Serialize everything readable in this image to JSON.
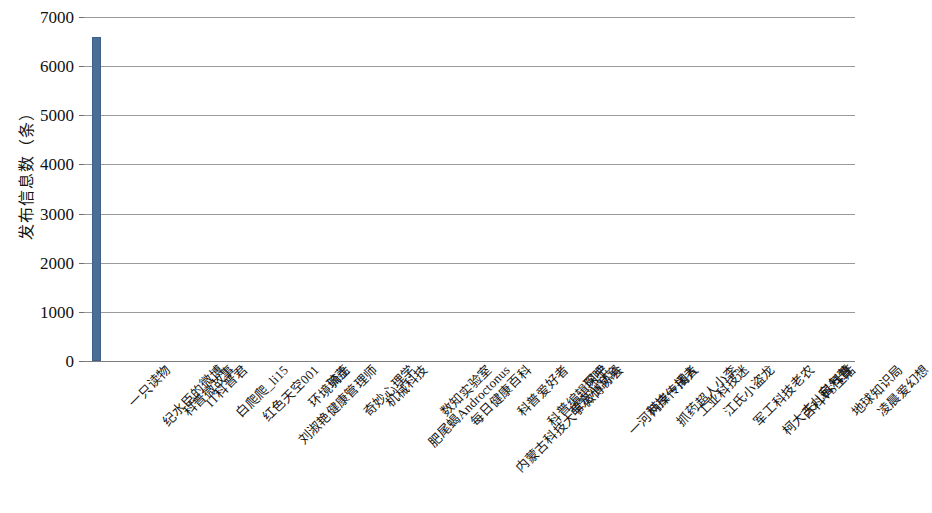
{
  "chart_data": {
    "type": "bar",
    "title": "",
    "xlabel": "",
    "ylabel": "发布信息数（条）",
    "ylim": [
      0,
      7000
    ],
    "ytick_labels": [
      "7000",
      "6000",
      "5000",
      "4000",
      "3000",
      "2000",
      "1000",
      "0"
    ],
    "ytick_values": [
      7000,
      6000,
      5000,
      4000,
      3000,
      2000,
      1000,
      0
    ],
    "grid": true,
    "legend": false,
    "bar_color": "#4a6e95",
    "categories": [
      "一只读物",
      "纪水臣的微博",
      "科普微故事",
      "IT科普君",
      "白爬爬_li15",
      "红色天空001",
      "刘淑艳健康管理师",
      "环境骑士",
      "琉荔",
      "奇妙心理学",
      "机械科技",
      "肥尾蝎Androctonus",
      "数知实验室",
      "每日健康百科",
      "内蒙古科技大学微博协会",
      "科普爱好者",
      "科普编辑阿宁",
      "萌宠小窝窝",
      "琛吧",
      "一河两岸一闲人",
      "科技传播者",
      "抓药超人小李",
      "工业科技迷",
      "江氏小盗龙",
      "军工科技老农",
      "柯大夫儿科科普",
      "百科VS生活",
      "宝气萱",
      "地球知识局",
      "凌晨爱幻想"
    ],
    "values": [
      6600,
      0,
      0,
      0,
      0,
      0,
      0,
      0,
      0,
      0,
      0,
      0,
      0,
      0,
      0,
      0,
      0,
      0,
      0,
      0,
      0,
      0,
      0,
      0,
      0,
      0,
      0,
      0,
      0,
      0
    ]
  }
}
